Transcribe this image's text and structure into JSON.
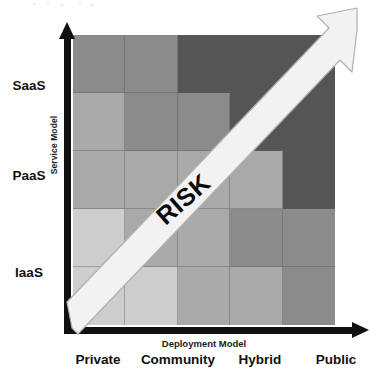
{
  "figure": {
    "risk_label": "RISK"
  },
  "axes": {
    "y_title": "Service Model",
    "x_title": "Deployment Model",
    "y_ticks": [
      "SaaS",
      "PaaS",
      "IaaS"
    ],
    "x_ticks": [
      "Private",
      "Community",
      "Hybrid",
      "Public"
    ]
  },
  "palette": {
    "level1": "#cdcdcd",
    "level2": "#a9a9a9",
    "level3": "#8b8b8b",
    "level4": "#555555",
    "arrow_fill": "#f2f2f2",
    "arrow_stroke": "#b4b4b4",
    "axis": "#111111",
    "grid_line": "#5a5a5a",
    "background": "#ffffff"
  },
  "chart_data": {
    "type": "heatmap",
    "xlabel": "Deployment Model",
    "ylabel": "Service Model",
    "x_categories": [
      "Private",
      "Community",
      "Hybrid",
      "Public"
    ],
    "y_categories": [
      "SaaS",
      "PaaS",
      "IaaS"
    ],
    "columns": 5,
    "rows": 5,
    "legend": "none",
    "grid": true,
    "annotations": [
      {
        "text": "RISK",
        "rotation": -41,
        "note": "white diagonal arrow running from bottom-left origin to top-right, indicating increasing risk"
      }
    ],
    "risk_levels": {
      "1": "#cdcdcd",
      "2": "#a9a9a9",
      "3": "#8b8b8b",
      "4": "#555555"
    },
    "matrix_top_to_bottom": [
      [
        3,
        3,
        4,
        4,
        4
      ],
      [
        2,
        3,
        3,
        4,
        4
      ],
      [
        2,
        2,
        2,
        2,
        4
      ],
      [
        1,
        2,
        2,
        3,
        3
      ],
      [
        1,
        1,
        2,
        2,
        3
      ]
    ]
  }
}
